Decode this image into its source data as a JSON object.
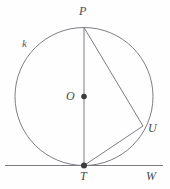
{
  "figure": {
    "name": "circle-tangent-inscribed-angle-diagram",
    "width": 170,
    "height": 189,
    "background_color": "#fefefe",
    "stroke_color": "#7d7d85",
    "label_color": "#4a4a4f",
    "point_fill_color": "#3a3a40"
  },
  "circle": {
    "label": "k",
    "label_x": 22,
    "label_y": 38,
    "center_x": 84,
    "center_y": 96.5,
    "radius": 69,
    "stroke_width": 1
  },
  "points": [
    {
      "id": "P",
      "label": "P",
      "x": 84,
      "y": 27.5,
      "label_x": 79,
      "label_y": 5,
      "marker": false,
      "description": "top-of-circle"
    },
    {
      "id": "O",
      "label": "O",
      "x": 84,
      "y": 96.5,
      "label_x": 66,
      "label_y": 90,
      "marker": true,
      "marker_radius": 2.8,
      "description": "center-of-circle"
    },
    {
      "id": "U",
      "label": "U",
      "x": 143,
      "y": 126,
      "label_x": 148,
      "label_y": 122,
      "marker": false,
      "description": "point-on-circle-right"
    },
    {
      "id": "T",
      "label": "T",
      "x": 84,
      "y": 165.5,
      "label_x": 80,
      "label_y": 170,
      "marker": true,
      "marker_radius": 3.0,
      "description": "tangency-point-bottom-of-circle"
    },
    {
      "id": "W",
      "label": "W",
      "x": 155,
      "y": 165.5,
      "label_x": 146,
      "label_y": 170,
      "marker": false,
      "description": "point-on-tangent-line-right"
    }
  ],
  "segments": [
    {
      "id": "PT",
      "from": "P",
      "to": "T",
      "x1": 84,
      "y1": 27.5,
      "x2": 84,
      "y2": 165.5,
      "description": "vertical-diameter"
    },
    {
      "id": "PU",
      "from": "P",
      "to": "U",
      "x1": 84,
      "y1": 27.5,
      "x2": 143,
      "y2": 126,
      "description": "chord-P-to-U"
    },
    {
      "id": "TU",
      "from": "T",
      "to": "U",
      "x1": 84,
      "y1": 165.5,
      "x2": 143,
      "y2": 126,
      "description": "chord-T-to-U"
    }
  ],
  "tangent_line": {
    "id": "tangent-TW",
    "x1": 5,
    "y1": 165.5,
    "x2": 163,
    "y2": 165.5,
    "description": "horizontal-tangent-line-through-T-toward-W"
  }
}
